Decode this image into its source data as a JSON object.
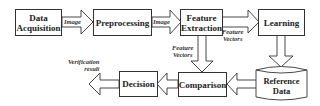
{
  "diagram": {
    "type": "flowchart",
    "nodes": {
      "data_acquisition": {
        "line1": "Data",
        "line2": "Acquisition"
      },
      "preprocessing": {
        "label": "Preprocessing"
      },
      "feature_extraction": {
        "line1": "Feature",
        "line2": "Extraction"
      },
      "learning": {
        "label": "Learning"
      },
      "reference_data": {
        "line1": "Reference",
        "line2": "Data"
      },
      "comparison": {
        "label": "Comparison"
      },
      "decision": {
        "label": "Decision"
      }
    },
    "edges": {
      "acq_to_pre": {
        "label": "Image"
      },
      "pre_to_fe": {
        "label": "Image"
      },
      "fe_to_learning": {
        "line1": "Feature",
        "line2": "Vectors"
      },
      "fe_to_comparison": {
        "line1": "Feature",
        "line2": "Vectors"
      },
      "learning_to_reference": {
        "label": ""
      },
      "reference_to_comparison": {
        "label": ""
      },
      "comparison_to_decision": {
        "label": ""
      },
      "decision_output": {
        "line1": "Verification",
        "line2": "result"
      }
    },
    "colors": {
      "stroke": "#333333",
      "fill": "#ffffff",
      "text": "#222222"
    }
  }
}
